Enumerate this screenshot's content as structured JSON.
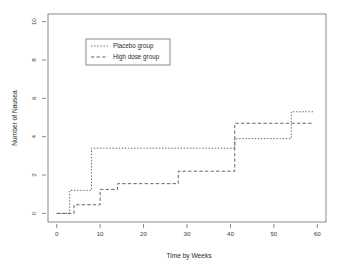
{
  "chart_data": {
    "type": "line",
    "subtype": "step",
    "title": "",
    "xlabel": "Time by Weeks",
    "ylabel": "Number of Nausea",
    "xlim": [
      -2,
      62
    ],
    "ylim": [
      -0.45,
      10.4
    ],
    "xticks": [
      0,
      10,
      20,
      30,
      40,
      50,
      60
    ],
    "xticklabels": [
      "0",
      "10",
      "20",
      "30",
      "40",
      "50",
      "60"
    ],
    "yticks": [
      0,
      2,
      4,
      6,
      8,
      10
    ],
    "yticklabels": [
      "0",
      "2",
      "4",
      "6",
      "8",
      "10"
    ],
    "grid": false,
    "legend_position": "upper-left-inset",
    "series": [
      {
        "name": "Placebo group",
        "linestyle": "dotted",
        "color": "#555555",
        "x": [
          0,
          3,
          3,
          8,
          8,
          41,
          41,
          54,
          54,
          59
        ],
        "y": [
          0,
          0,
          1.2,
          1.2,
          3.4,
          3.4,
          3.9,
          3.9,
          5.3,
          5.3
        ],
        "steps": [
          {
            "from_week": 0,
            "to_week": 3,
            "value": 0
          },
          {
            "from_week": 3,
            "to_week": 8,
            "value": 1.2
          },
          {
            "from_week": 8,
            "to_week": 41,
            "value": 3.4
          },
          {
            "from_week": 41,
            "to_week": 54,
            "value": 3.9
          },
          {
            "from_week": 54,
            "to_week": 59,
            "value": 5.3
          }
        ]
      },
      {
        "name": "High dose group",
        "linestyle": "dashed",
        "color": "#555555",
        "x": [
          0,
          4,
          4,
          10,
          10,
          14,
          14,
          28,
          28,
          41,
          41,
          59
        ],
        "y": [
          0,
          0,
          0.45,
          0.45,
          1.25,
          1.25,
          1.55,
          1.55,
          2.2,
          2.2,
          4.7,
          4.7
        ],
        "steps": [
          {
            "from_week": 0,
            "to_week": 4,
            "value": 0
          },
          {
            "from_week": 4,
            "to_week": 10,
            "value": 0.45
          },
          {
            "from_week": 10,
            "to_week": 14,
            "value": 1.25
          },
          {
            "from_week": 14,
            "to_week": 28,
            "value": 1.55
          },
          {
            "from_week": 28,
            "to_week": 41,
            "value": 2.2
          },
          {
            "from_week": 41,
            "to_week": 59,
            "value": 4.7
          }
        ]
      }
    ]
  },
  "legend": {
    "entries": [
      {
        "label": "Placebo group"
      },
      {
        "label": "High dose group"
      }
    ]
  }
}
